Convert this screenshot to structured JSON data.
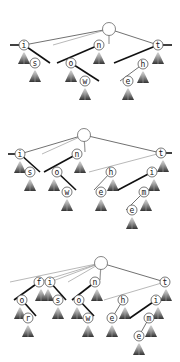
{
  "diagram": {
    "title": "",
    "colors": {
      "node_stroke": "#555555",
      "edge": "#333333",
      "subtree_dark": "#333333",
      "subtree_light": "#ffffff",
      "background": "#ffffff"
    },
    "panels": [
      {
        "id": "panel-1",
        "root": {
          "x": 109,
          "y": 29,
          "r": 6.5
        },
        "nodes": [
          {
            "id": "i",
            "label": "i",
            "x": 24,
            "y": 45
          },
          {
            "id": "s",
            "label": "s",
            "x": 35,
            "y": 63
          },
          {
            "id": "n",
            "label": "n",
            "x": 99,
            "y": 45
          },
          {
            "id": "o",
            "label": "o",
            "x": 71,
            "y": 63
          },
          {
            "id": "w",
            "label": "w",
            "x": 85,
            "y": 81
          },
          {
            "id": "t",
            "label": "t",
            "x": 158,
            "y": 45
          },
          {
            "id": "h",
            "label": "h",
            "x": 143,
            "y": 64
          },
          {
            "id": "e",
            "label": "e",
            "x": 128,
            "y": 81
          }
        ],
        "edges": [
          {
            "from": [
              109,
              29
            ],
            "to": [
              24,
              45
            ],
            "style": "edge"
          },
          {
            "from": [
              109,
              29
            ],
            "to": [
              53,
              45
            ],
            "style": "edge-light"
          },
          {
            "from": [
              109,
              29
            ],
            "to": [
              158,
              45
            ],
            "style": "edge"
          },
          {
            "from": [
              109,
              29
            ],
            "to": [
              109,
              44
            ],
            "style": "stem"
          },
          {
            "from": [
              10,
              45
            ],
            "to": [
              24,
              45
            ],
            "style": "edge-thick"
          },
          {
            "from": [
              24,
              45
            ],
            "to": [
              50,
              63
            ],
            "style": "edge-thick"
          },
          {
            "from": [
              99,
              45
            ],
            "to": [
              57,
              63
            ],
            "style": "edge-thick"
          },
          {
            "from": [
              71,
              63
            ],
            "to": [
              99,
              81
            ],
            "style": "edge-thick"
          },
          {
            "from": [
              158,
              45
            ],
            "to": [
              172,
              45
            ],
            "style": "edge-thick"
          },
          {
            "from": [
              158,
              45
            ],
            "to": [
              114,
              63
            ],
            "style": "edge-thick"
          },
          {
            "from": [
              143,
              64
            ],
            "to": [
              120,
              81
            ],
            "style": "edge"
          }
        ],
        "subtrees": [
          {
            "x": 24,
            "y": 51
          },
          {
            "x": 35,
            "y": 69
          },
          {
            "x": 99,
            "y": 51
          },
          {
            "x": 71,
            "y": 69
          },
          {
            "x": 85,
            "y": 87
          },
          {
            "x": 158,
            "y": 51
          },
          {
            "x": 143,
            "y": 70
          },
          {
            "x": 128,
            "y": 87
          }
        ]
      },
      {
        "id": "panel-2",
        "root": {
          "x": 84,
          "y": 135,
          "r": 6.5
        },
        "nodes": [
          {
            "id": "i",
            "label": "i",
            "x": 20,
            "y": 154
          },
          {
            "id": "s",
            "label": "s",
            "x": 30,
            "y": 172
          },
          {
            "id": "n",
            "label": "n",
            "x": 77,
            "y": 154
          },
          {
            "id": "o",
            "label": "o",
            "x": 57,
            "y": 172
          },
          {
            "id": "w",
            "label": "w",
            "x": 67,
            "y": 192
          },
          {
            "id": "t",
            "label": "t",
            "x": 161,
            "y": 153
          },
          {
            "id": "h",
            "label": "h",
            "x": 111,
            "y": 172
          },
          {
            "id": "e",
            "label": "e",
            "x": 101,
            "y": 192
          },
          {
            "id": "i2",
            "label": "i",
            "x": 152,
            "y": 172
          },
          {
            "id": "m",
            "label": "m",
            "x": 144,
            "y": 192
          },
          {
            "id": "e2",
            "label": "e",
            "x": 132,
            "y": 210
          }
        ],
        "edges": [
          {
            "from": [
              84,
              135
            ],
            "to": [
              20,
              154
            ],
            "style": "edge"
          },
          {
            "from": [
              84,
              135
            ],
            "to": [
              42,
              154
            ],
            "style": "edge-light"
          },
          {
            "from": [
              84,
              135
            ],
            "to": [
              161,
              153
            ],
            "style": "edge"
          },
          {
            "from": [
              84,
              135
            ],
            "to": [
              85,
              152
            ],
            "style": "stem"
          },
          {
            "from": [
              8,
              154
            ],
            "to": [
              20,
              154
            ],
            "style": "edge-thick"
          },
          {
            "from": [
              20,
              154
            ],
            "to": [
              40,
              172
            ],
            "style": "edge-thick"
          },
          {
            "from": [
              77,
              154
            ],
            "to": [
              44,
              172
            ],
            "style": "edge-thick"
          },
          {
            "from": [
              57,
              172
            ],
            "to": [
              76,
              190
            ],
            "style": "edge-thick"
          },
          {
            "from": [
              161,
              153
            ],
            "to": [
              172,
              153
            ],
            "style": "edge-thick"
          },
          {
            "from": [
              161,
              153
            ],
            "to": [
              89,
              172
            ],
            "style": "edge-light"
          },
          {
            "from": [
              111,
              172
            ],
            "to": [
              94,
              190
            ],
            "style": "edge"
          },
          {
            "from": [
              152,
              172
            ],
            "to": [
              118,
              190
            ],
            "style": "edge-thick"
          },
          {
            "from": [
              144,
              192
            ],
            "to": [
              126,
              210
            ],
            "style": "edge"
          }
        ],
        "subtrees": [
          {
            "x": 20,
            "y": 160
          },
          {
            "x": 30,
            "y": 178
          },
          {
            "x": 80,
            "y": 160
          },
          {
            "x": 54,
            "y": 178
          },
          {
            "x": 67,
            "y": 198
          },
          {
            "x": 163,
            "y": 159
          },
          {
            "x": 113,
            "y": 178
          },
          {
            "x": 101,
            "y": 198
          },
          {
            "x": 154,
            "y": 178
          },
          {
            "x": 146,
            "y": 198
          },
          {
            "x": 132,
            "y": 216
          }
        ]
      },
      {
        "id": "panel-3",
        "root": {
          "x": 101,
          "y": 263,
          "r": 6.5
        },
        "nodes": [
          {
            "id": "f",
            "label": "f",
            "x": 39,
            "y": 282
          },
          {
            "id": "i",
            "label": "i",
            "x": 50,
            "y": 282
          },
          {
            "id": "o",
            "label": "o",
            "x": 22,
            "y": 300
          },
          {
            "id": "r",
            "label": "r",
            "x": 28,
            "y": 318
          },
          {
            "id": "s",
            "label": "s",
            "x": 58,
            "y": 300
          },
          {
            "id": "n",
            "label": "n",
            "x": 95,
            "y": 282
          },
          {
            "id": "o2",
            "label": "o",
            "x": 79,
            "y": 300
          },
          {
            "id": "w",
            "label": "w",
            "x": 88,
            "y": 318
          },
          {
            "id": "t",
            "label": "t",
            "x": 165,
            "y": 282
          },
          {
            "id": "h",
            "label": "h",
            "x": 123,
            "y": 300
          },
          {
            "id": "e",
            "label": "e",
            "x": 112,
            "y": 318
          },
          {
            "id": "i2",
            "label": "i",
            "x": 156,
            "y": 300
          },
          {
            "id": "m",
            "label": "m",
            "x": 149,
            "y": 318
          },
          {
            "id": "e2",
            "label": "e",
            "x": 139,
            "y": 336
          }
        ],
        "edges": [
          {
            "from": [
              101,
              263
            ],
            "to": [
              10,
              282
            ],
            "style": "edge-light"
          },
          {
            "from": [
              101,
              263
            ],
            "to": [
              39,
              282
            ],
            "style": "edge-light"
          },
          {
            "from": [
              101,
              263
            ],
            "to": [
              50,
              282
            ],
            "style": "edge-light"
          },
          {
            "from": [
              101,
              263
            ],
            "to": [
              68,
              282
            ],
            "style": "edge-light"
          },
          {
            "from": [
              101,
              263
            ],
            "to": [
              165,
              282
            ],
            "style": "edge"
          },
          {
            "from": [
              101,
              263
            ],
            "to": [
              100,
              280
            ],
            "style": "stem"
          },
          {
            "from": [
              39,
              282
            ],
            "to": [
              14,
              300
            ],
            "style": "edge-thick"
          },
          {
            "from": [
              22,
              300
            ],
            "to": [
              36,
              316
            ],
            "style": "edge-thick"
          },
          {
            "from": [
              50,
              282
            ],
            "to": [
              66,
              300
            ],
            "style": "edge-thick"
          },
          {
            "from": [
              95,
              282
            ],
            "to": [
              72,
              300
            ],
            "style": "edge-thick"
          },
          {
            "from": [
              79,
              300
            ],
            "to": [
              94,
              316
            ],
            "style": "edge-thick"
          },
          {
            "from": [
              165,
              282
            ],
            "to": [
              104,
              300
            ],
            "style": "edge-light"
          },
          {
            "from": [
              123,
              300
            ],
            "to": [
              112,
              318
            ],
            "style": "edge"
          },
          {
            "from": [
              156,
              300
            ],
            "to": [
              130,
              318
            ],
            "style": "edge-thick"
          },
          {
            "from": [
              149,
              318
            ],
            "to": [
              139,
              336
            ],
            "style": "edge"
          }
        ],
        "subtrees": [
          {
            "x": 41,
            "y": 288
          },
          {
            "x": 48,
            "y": 288
          },
          {
            "x": 20,
            "y": 306
          },
          {
            "x": 28,
            "y": 324
          },
          {
            "x": 58,
            "y": 306
          },
          {
            "x": 97,
            "y": 288
          },
          {
            "x": 77,
            "y": 306
          },
          {
            "x": 88,
            "y": 324
          },
          {
            "x": 166,
            "y": 288
          },
          {
            "x": 125,
            "y": 306
          },
          {
            "x": 112,
            "y": 324
          },
          {
            "x": 158,
            "y": 306
          },
          {
            "x": 151,
            "y": 324
          },
          {
            "x": 139,
            "y": 342
          }
        ]
      }
    ]
  }
}
